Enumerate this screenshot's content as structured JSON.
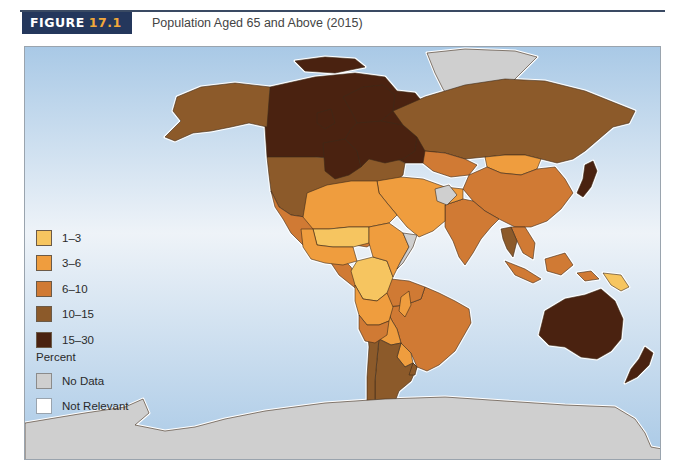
{
  "figure": {
    "label_word": "FIGURE",
    "label_number": "17.1",
    "title": "Population Aged 65 and Above (2015)"
  },
  "colors": {
    "header_bg": "#24375c",
    "header_number": "#f2a83a",
    "ocean_top": "#a9c9e6",
    "ocean_mid": "#eef3f8",
    "ocean_bottom": "#a9c9e6",
    "coast_halo": "#ffffff",
    "border": "#3d2a1a"
  },
  "legend": {
    "heading": "Percent",
    "classes": [
      {
        "label": "1–3",
        "color": "#f6c560"
      },
      {
        "label": "3–6",
        "color": "#ef9d3e"
      },
      {
        "label": "6–10",
        "color": "#d07a34"
      },
      {
        "label": "10–15",
        "color": "#8c5a2a"
      },
      {
        "label": "15–30",
        "color": "#4a2210"
      }
    ],
    "special": [
      {
        "label": "No Data",
        "color": "#cfcfcf"
      },
      {
        "label": "Not Relevant",
        "color": "#ffffff"
      }
    ]
  },
  "chart_data": {
    "type": "choropleth",
    "title": "Population Aged 65 and Above (2015)",
    "unit": "Percent",
    "classes": [
      "1–3",
      "3–6",
      "6–10",
      "10–15",
      "15–30",
      "No Data",
      "Not Relevant"
    ],
    "regions": [
      {
        "name": "Canada",
        "class": "15–30"
      },
      {
        "name": "Alaska (USA)",
        "class": "10–15"
      },
      {
        "name": "United States",
        "class": "10–15"
      },
      {
        "name": "Greenland",
        "class": "No Data"
      },
      {
        "name": "Mexico",
        "class": "6–10"
      },
      {
        "name": "Central America",
        "class": "6–10"
      },
      {
        "name": "Caribbean",
        "class": "6–10"
      },
      {
        "name": "Brazil",
        "class": "6–10"
      },
      {
        "name": "Northern South America",
        "class": "6–10"
      },
      {
        "name": "Bolivia",
        "class": "3–6"
      },
      {
        "name": "Paraguay",
        "class": "3–6"
      },
      {
        "name": "Argentina",
        "class": "10–15"
      },
      {
        "name": "Chile",
        "class": "10–15"
      },
      {
        "name": "Uruguay",
        "class": "10–15"
      },
      {
        "name": "Western Europe",
        "class": "15–30"
      },
      {
        "name": "Scandinavia",
        "class": "15–30"
      },
      {
        "name": "Eastern Europe",
        "class": "15–30"
      },
      {
        "name": "Russia",
        "class": "10–15"
      },
      {
        "name": "Kazakhstan",
        "class": "6–10"
      },
      {
        "name": "Mongolia",
        "class": "3–6"
      },
      {
        "name": "China",
        "class": "6–10"
      },
      {
        "name": "Japan",
        "class": "15–30"
      },
      {
        "name": "India",
        "class": "6–10"
      },
      {
        "name": "Middle East",
        "class": "3–6"
      },
      {
        "name": "Afghanistan",
        "class": "No Data"
      },
      {
        "name": "North Africa",
        "class": "3–6"
      },
      {
        "name": "Sahel",
        "class": "1–3"
      },
      {
        "name": "West Africa",
        "class": "3–6"
      },
      {
        "name": "Central Africa",
        "class": "1–3"
      },
      {
        "name": "East Africa",
        "class": "3–6"
      },
      {
        "name": "Somalia",
        "class": "No Data"
      },
      {
        "name": "Southern Africa",
        "class": "3–6"
      },
      {
        "name": "South Africa",
        "class": "6–10"
      },
      {
        "name": "Madagascar",
        "class": "3–6"
      },
      {
        "name": "Southeast Asia",
        "class": "6–10"
      },
      {
        "name": "Thailand",
        "class": "10–15"
      },
      {
        "name": "Indonesia",
        "class": "6–10"
      },
      {
        "name": "Papua New Guinea",
        "class": "1–3"
      },
      {
        "name": "Australia",
        "class": "15–30"
      },
      {
        "name": "New Zealand",
        "class": "15–30"
      },
      {
        "name": "Antarctica",
        "class": "No Data"
      }
    ]
  }
}
